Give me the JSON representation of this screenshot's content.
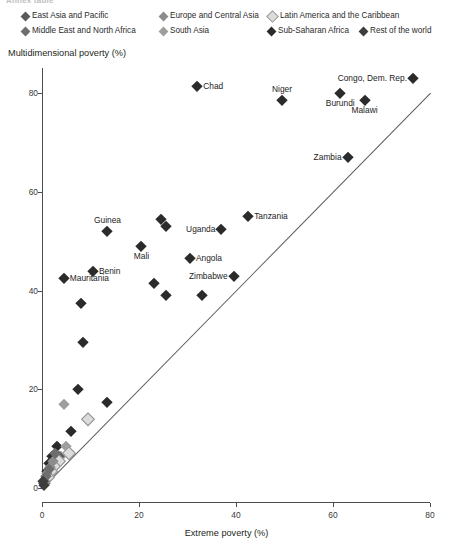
{
  "figure": {
    "clipped_header": "Annex table",
    "legend": {
      "items": [
        {
          "label": "East Asia and Pacific",
          "color": "#5a5a5a",
          "x": 22,
          "y": 0
        },
        {
          "label": "Europe and Central Asia",
          "color": "#8c8c8c",
          "x": 160,
          "y": 0
        },
        {
          "label": "Latin America and the Caribbean",
          "color": "#dcdcdc",
          "x": 268,
          "y": 0
        },
        {
          "label": "Middle East and North Africa",
          "color": "#6e6e6e",
          "x": 22,
          "y": 15
        },
        {
          "label": "South Asia",
          "color": "#9e9e9e",
          "x": 160,
          "y": 15
        },
        {
          "label": "Sub-Saharan Africa",
          "color": "#2b2b2b",
          "x": 268,
          "y": 15
        },
        {
          "label": "Rest of the world",
          "color": "#3d3d3d",
          "x": 360,
          "y": 15
        }
      ]
    }
  },
  "chart_data": {
    "type": "scatter",
    "title": "",
    "xlabel": "Extreme poverty (%)",
    "ylabel": "Multidimensional poverty (%)",
    "xlim": [
      0,
      80
    ],
    "ylim": [
      0,
      80
    ],
    "xticks": [
      0,
      20,
      40,
      60,
      80
    ],
    "yticks": [
      0,
      20,
      40,
      60,
      80
    ],
    "grid": false,
    "legend_position": "top",
    "reference_line": {
      "type": "identity",
      "from": [
        0,
        0
      ],
      "to": [
        80,
        80
      ],
      "label": "45-degree line"
    },
    "series": [
      {
        "name": "Sub-Saharan Africa",
        "color": "#2b2b2b",
        "points": [
          {
            "label": "Congo, Dem. Rep.",
            "x": 76.5,
            "y": 83.0,
            "lp": "left"
          },
          {
            "label": "Chad",
            "x": 32.0,
            "y": 81.5,
            "lp": "right"
          },
          {
            "label": "Burundi",
            "x": 61.5,
            "y": 80.0,
            "lp": "below"
          },
          {
            "label": "Niger",
            "x": 49.5,
            "y": 78.5,
            "lp": "above"
          },
          {
            "label": "Malawi",
            "x": 66.5,
            "y": 78.5,
            "lp": "below"
          },
          {
            "label": "Zambia",
            "x": 63.0,
            "y": 67.0,
            "lp": "left"
          },
          {
            "label": "Tanzania",
            "x": 42.5,
            "y": 55.0,
            "lp": "right"
          },
          {
            "label": "",
            "x": 24.5,
            "y": 54.5,
            "lp": "none"
          },
          {
            "label": "",
            "x": 25.5,
            "y": 53.0,
            "lp": "none"
          },
          {
            "label": "Uganda",
            "x": 37.0,
            "y": 52.5,
            "lp": "left"
          },
          {
            "label": "Guinea",
            "x": 13.5,
            "y": 52.0,
            "lp": "above"
          },
          {
            "label": "Mali",
            "x": 20.5,
            "y": 49.0,
            "lp": "below"
          },
          {
            "label": "Angola",
            "x": 30.5,
            "y": 46.5,
            "lp": "right"
          },
          {
            "label": "Benin",
            "x": 10.5,
            "y": 44.0,
            "lp": "right"
          },
          {
            "label": "Zimbabwe",
            "x": 39.5,
            "y": 43.0,
            "lp": "left"
          },
          {
            "label": "",
            "x": 23.0,
            "y": 41.5,
            "lp": "none"
          },
          {
            "label": "Mauritania",
            "x": 4.5,
            "y": 42.5,
            "lp": "right"
          },
          {
            "label": "",
            "x": 25.5,
            "y": 39.0,
            "lp": "none"
          },
          {
            "label": "",
            "x": 33.0,
            "y": 39.0,
            "lp": "none"
          },
          {
            "label": "",
            "x": 8.0,
            "y": 37.5,
            "lp": "none"
          },
          {
            "label": "",
            "x": 8.5,
            "y": 29.5,
            "lp": "none"
          },
          {
            "label": "",
            "x": 7.5,
            "y": 20.0,
            "lp": "none"
          },
          {
            "label": "",
            "x": 13.5,
            "y": 17.5,
            "lp": "none"
          },
          {
            "label": "",
            "x": 6.0,
            "y": 11.5,
            "lp": "none"
          },
          {
            "label": "",
            "x": 3.0,
            "y": 8.5,
            "lp": "none"
          },
          {
            "label": "",
            "x": 2.0,
            "y": 6.5,
            "lp": "none"
          },
          {
            "label": "",
            "x": 1.5,
            "y": 5.0,
            "lp": "none"
          },
          {
            "label": "",
            "x": 1.0,
            "y": 3.5,
            "lp": "none"
          },
          {
            "label": "",
            "x": 0.8,
            "y": 2.0,
            "lp": "none"
          },
          {
            "label": "",
            "x": 0.5,
            "y": 1.0,
            "lp": "none"
          }
        ]
      },
      {
        "name": "South Asia",
        "color": "#9e9e9e",
        "points": [
          {
            "label": "",
            "x": 4.5,
            "y": 17.0,
            "lp": "none"
          },
          {
            "label": "",
            "x": 5.0,
            "y": 8.5,
            "lp": "none"
          },
          {
            "label": "",
            "x": 4.0,
            "y": 6.5,
            "lp": "none"
          },
          {
            "label": "",
            "x": 2.5,
            "y": 5.0,
            "lp": "none"
          },
          {
            "label": "",
            "x": 1.8,
            "y": 4.0,
            "lp": "none"
          },
          {
            "label": "",
            "x": 1.2,
            "y": 2.5,
            "lp": "none"
          }
        ]
      },
      {
        "name": "East Asia and Pacific",
        "color": "#5a5a5a",
        "points": [
          {
            "label": "",
            "x": 3.5,
            "y": 6.5,
            "lp": "none"
          },
          {
            "label": "",
            "x": 2.8,
            "y": 5.5,
            "lp": "none"
          },
          {
            "label": "",
            "x": 2.0,
            "y": 4.5,
            "lp": "none"
          },
          {
            "label": "",
            "x": 1.5,
            "y": 3.0,
            "lp": "none"
          },
          {
            "label": "",
            "x": 1.0,
            "y": 1.8,
            "lp": "none"
          },
          {
            "label": "",
            "x": 0.6,
            "y": 1.0,
            "lp": "none"
          }
        ]
      },
      {
        "name": "Latin America and the Caribbean",
        "color": "#dcdcdc",
        "points": [
          {
            "label": "",
            "x": 9.5,
            "y": 14.0,
            "lp": "none"
          },
          {
            "label": "",
            "x": 5.5,
            "y": 7.0,
            "lp": "none"
          },
          {
            "label": "",
            "x": 3.5,
            "y": 5.5,
            "lp": "none"
          },
          {
            "label": "",
            "x": 2.5,
            "y": 4.5,
            "lp": "none"
          },
          {
            "label": "",
            "x": 1.8,
            "y": 3.5,
            "lp": "none"
          },
          {
            "label": "",
            "x": 1.2,
            "y": 2.2,
            "lp": "none"
          }
        ]
      },
      {
        "name": "Europe and Central Asia",
        "color": "#8c8c8c",
        "points": [
          {
            "label": "",
            "x": 2.2,
            "y": 5.5,
            "lp": "none"
          },
          {
            "label": "",
            "x": 1.6,
            "y": 4.2,
            "lp": "none"
          },
          {
            "label": "",
            "x": 1.0,
            "y": 3.0,
            "lp": "none"
          },
          {
            "label": "",
            "x": 0.6,
            "y": 1.5,
            "lp": "none"
          }
        ]
      },
      {
        "name": "Middle East and North Africa",
        "color": "#6e6e6e",
        "points": [
          {
            "label": "",
            "x": 2.6,
            "y": 7.0,
            "lp": "none"
          },
          {
            "label": "",
            "x": 1.4,
            "y": 3.8,
            "lp": "none"
          },
          {
            "label": "",
            "x": 0.9,
            "y": 2.4,
            "lp": "none"
          }
        ]
      },
      {
        "name": "Rest of the world",
        "color": "#3d3d3d",
        "points": [
          {
            "label": "",
            "x": 0.4,
            "y": 0.6,
            "lp": "none"
          },
          {
            "label": "",
            "x": 0.3,
            "y": 1.4,
            "lp": "none"
          }
        ]
      }
    ]
  }
}
